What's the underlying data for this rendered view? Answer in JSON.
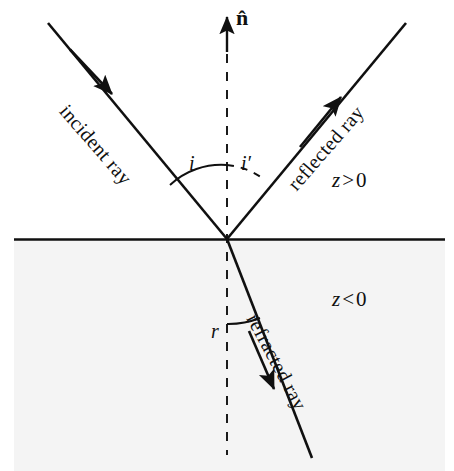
{
  "figure": {
    "kind": "optics-ray-diagram",
    "background_color": "#ffffff",
    "lower_medium_color": "#f4f4f4",
    "ink_color": "#101010"
  },
  "normal": {
    "label": "n̂",
    "arrow_direction": "up",
    "line_style": "dashed"
  },
  "rays": {
    "incident": {
      "label": "incident ray",
      "rotation_deg": 49,
      "arrow_direction": "toward-origin"
    },
    "reflected": {
      "label": "reflected ray",
      "rotation_deg": -49,
      "arrow_direction": "away-from-origin"
    },
    "refracted": {
      "label": "refracted ray",
      "rotation_deg": 62,
      "arrow_direction": "away-from-origin"
    }
  },
  "angles": {
    "incidence": {
      "label": "i",
      "arc_style": "solid"
    },
    "reflection": {
      "label": "i′",
      "arc_style": "dashed"
    },
    "refraction": {
      "label": "r",
      "arc_style": "solid"
    }
  },
  "regions": {
    "upper": {
      "variable": "z",
      "relation": ">",
      "value": "0"
    },
    "lower": {
      "variable": "z",
      "relation": "<",
      "value": "0"
    }
  }
}
